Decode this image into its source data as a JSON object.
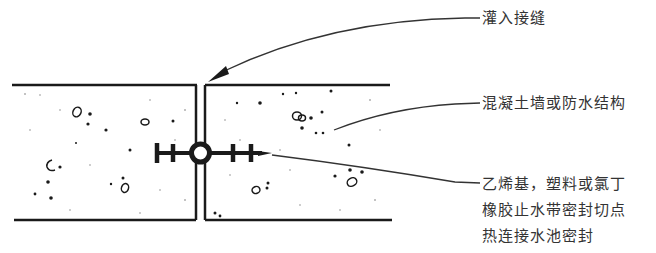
{
  "diagram": {
    "type": "cross-section",
    "labels": {
      "injection_joint": "灌入接缝",
      "concrete_wall": "混凝土墙或防水结构",
      "waterstop": {
        "line1": "乙烯基，塑料或氯丁",
        "line2": "橡胶止水带密封切点",
        "line3": "热连接水池密封"
      }
    },
    "colors": {
      "ink": "#1a1a1a",
      "text": "#333333",
      "background": "#ffffff"
    }
  }
}
